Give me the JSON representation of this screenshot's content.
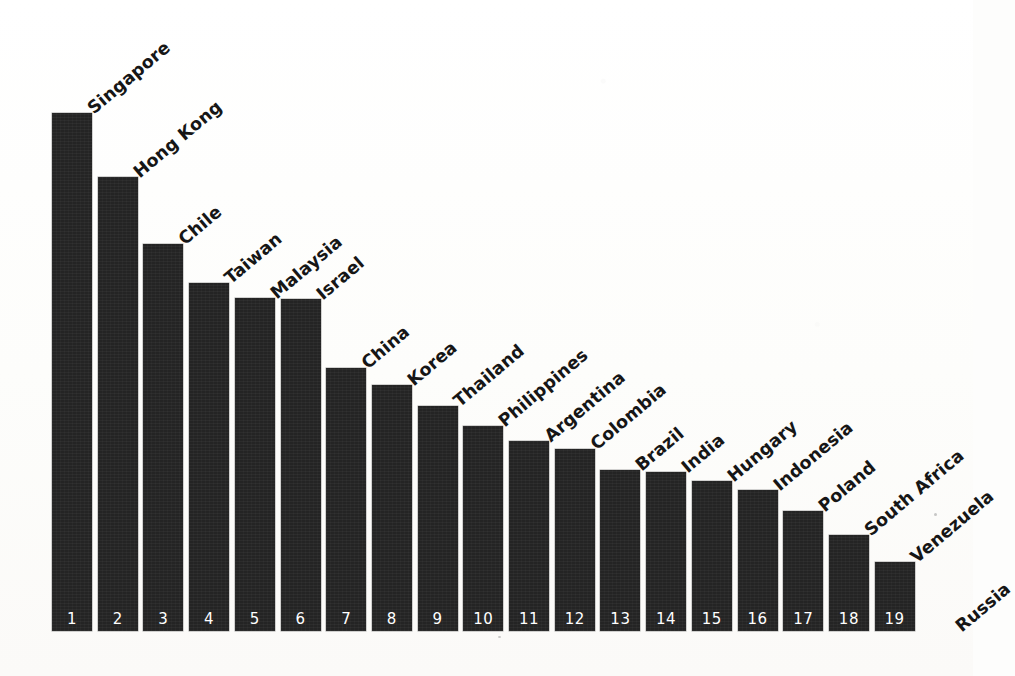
{
  "chart_data": {
    "type": "bar",
    "title": "",
    "subtitle": "",
    "xlabel": "",
    "ylabel": "",
    "grid": false,
    "legend": null,
    "axis_line": false,
    "value_unit": "relative index (read from bar height)",
    "ylim": [
      0,
      100
    ],
    "categories": [
      "Singapore",
      "Hong Kong",
      "Chile",
      "Taiwan",
      "Malaysia",
      "Israel",
      "China",
      "Korea",
      "Thailand",
      "Philippines",
      "Argentina",
      "Colombia",
      "Brazil",
      "India",
      "Hungary",
      "Indonesia",
      "Poland",
      "South Africa",
      "Venezuela",
      "Russia"
    ],
    "values": [
      100,
      87.6,
      74.7,
      67.2,
      64.3,
      64.1,
      50.8,
      47.5,
      43.4,
      39.6,
      36.7,
      35.1,
      31.1,
      30.7,
      28.9,
      27.2,
      23.2,
      18.5,
      13.3,
      0
    ],
    "rank_labels": [
      "1",
      "2",
      "3",
      "4",
      "5",
      "6",
      "7",
      "8",
      "9",
      "10",
      "11",
      "12",
      "13",
      "14",
      "15",
      "16",
      "17",
      "18",
      "19"
    ],
    "bar_count": 19,
    "label_count": 20,
    "note_unbarred_categories": [
      "Russia"
    ],
    "bar_color": "#242424",
    "rank_text_color": "#ffffff",
    "label_text_color": "#161616",
    "background_color": "#fdfdfc",
    "label_rotation_deg": -40,
    "geometry": {
      "baseline_y": 631,
      "plot_top_y": 113,
      "first_bar_left_x": 52,
      "bar_width": 40,
      "bar_pitch": 45.7,
      "bar_tops_y": [
        113,
        177,
        244,
        283,
        298,
        299,
        368,
        385,
        406,
        426,
        441,
        449,
        470,
        472,
        481,
        490,
        511,
        535,
        562
      ]
    }
  }
}
